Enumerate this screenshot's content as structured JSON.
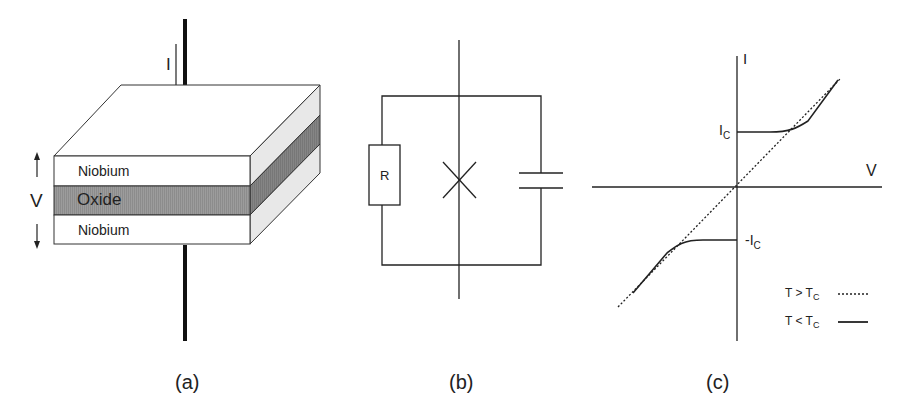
{
  "panels": {
    "a": {
      "caption": "(a)",
      "current_label": "I",
      "voltage_label": "V",
      "layers": [
        "Niobium",
        "Oxide",
        "Niobium"
      ]
    },
    "b": {
      "caption": "(b)",
      "resistor_label": "R"
    },
    "c": {
      "caption": "(c)",
      "y_axis_label": "I",
      "x_axis_label": "V",
      "ic_label": "I",
      "ic_sub": "C",
      "neg_ic_label": "-I",
      "neg_ic_sub": "C",
      "legend": [
        {
          "label": "T > T",
          "sub": "C",
          "style": "dotted"
        },
        {
          "label": "T < T",
          "sub": "C",
          "style": "solid"
        }
      ]
    }
  },
  "colors": {
    "line": "#222222",
    "oxide": "#9a9a9a",
    "side_light": "#e6e6e6",
    "side_dark": "#7f7f7f"
  }
}
